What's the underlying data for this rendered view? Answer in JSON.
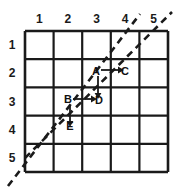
{
  "figure": {
    "type": "grid-diagram",
    "background_color": "#ffffff",
    "line_color": "#1a1a1a",
    "grid": {
      "rows": 5,
      "cols": 5,
      "x0": 25,
      "y0": 31,
      "cell_w": 28.6,
      "cell_h": 28.2,
      "stroke_width": 2.2
    },
    "column_labels": [
      "1",
      "2",
      "3",
      "4",
      "5"
    ],
    "row_labels": [
      "1",
      "2",
      "3",
      "4",
      "5"
    ],
    "points": [
      {
        "label": "A",
        "x": 96,
        "y": 72
      },
      {
        "label": "C",
        "x": 125,
        "y": 72
      },
      {
        "label": "B",
        "x": 68,
        "y": 100
      },
      {
        "label": "D",
        "x": 99,
        "y": 101
      },
      {
        "label": "E",
        "x": 70,
        "y": 127
      }
    ],
    "arrows": [
      {
        "name": "a-to-c",
        "from": "A",
        "to": "C",
        "direction": "right",
        "x1": 101,
        "y1": 70,
        "x2": 120,
        "y2": 70
      },
      {
        "name": "a-to-d",
        "from": "A",
        "to": "D",
        "direction": "down",
        "x1": 98,
        "y1": 76,
        "x2": 98,
        "y2": 95
      },
      {
        "name": "b-to-d",
        "from": "B",
        "to": "D",
        "direction": "right",
        "x1": 73,
        "y1": 99,
        "x2": 93,
        "y2": 99
      },
      {
        "name": "b-to-e",
        "from": "B",
        "to": "E",
        "direction": "down",
        "x1": 70,
        "y1": 105,
        "x2": 70,
        "y2": 123
      }
    ],
    "dashed_lines": [
      {
        "name": "upper-diagonal",
        "x1": 25,
        "y1": 158,
        "x2": 172,
        "y2": 12,
        "dash": "7 5",
        "stroke_width": 2.6
      },
      {
        "name": "lower-diagonal",
        "x1": 8,
        "y1": 186,
        "x2": 140,
        "y2": 14,
        "dash": "7 5",
        "stroke_width": 2.6
      }
    ]
  }
}
